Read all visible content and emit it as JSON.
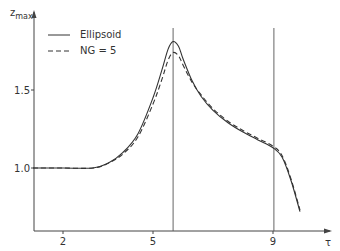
{
  "chart_data": {
    "type": "line",
    "title": "",
    "xlabel": "τ",
    "ylabel": "z_max",
    "ylabel_main": "z",
    "ylabel_sub": "max",
    "xlim": [
      1.0,
      11.3
    ],
    "ylim": [
      0.6,
      1.95
    ],
    "x_ticks": [
      2,
      5,
      9
    ],
    "x_tick_labels": [
      "2",
      "5",
      "9"
    ],
    "y_ticks": [
      1.0,
      1.5
    ],
    "y_tick_labels": [
      "1.0",
      "1.5"
    ],
    "grid": false,
    "legend_position": "upper-left",
    "vertical_lines": [
      5.67,
      9.03
    ],
    "series": [
      {
        "name": "Ellipsoid",
        "style": "solid",
        "x": [
          1.0,
          2.0,
          3.0,
          3.5,
          4.0,
          4.5,
          5.0,
          5.3,
          5.5,
          5.67,
          5.85,
          6.0,
          6.3,
          6.6,
          7.0,
          7.5,
          8.0,
          8.5,
          9.0,
          9.3,
          9.6,
          9.9
        ],
        "y": [
          1.0,
          1.0,
          1.0,
          1.03,
          1.1,
          1.22,
          1.45,
          1.63,
          1.76,
          1.81,
          1.78,
          1.7,
          1.56,
          1.46,
          1.37,
          1.29,
          1.23,
          1.18,
          1.13,
          1.07,
          0.92,
          0.72
        ]
      },
      {
        "name": "NG = 5",
        "style": "dashed",
        "x": [
          1.0,
          2.0,
          3.0,
          3.5,
          4.0,
          4.5,
          5.0,
          5.3,
          5.5,
          5.67,
          5.85,
          6.0,
          6.3,
          6.6,
          7.0,
          7.5,
          8.0,
          8.5,
          9.0,
          9.3,
          9.6,
          9.9
        ],
        "y": [
          1.0,
          1.0,
          1.0,
          1.03,
          1.09,
          1.2,
          1.41,
          1.57,
          1.69,
          1.74,
          1.72,
          1.66,
          1.55,
          1.47,
          1.38,
          1.3,
          1.24,
          1.19,
          1.14,
          1.08,
          0.93,
          0.73
        ]
      }
    ]
  },
  "legend": {
    "items": [
      {
        "label": "Ellipsoid",
        "style": "solid"
      },
      {
        "label": "NG = 5",
        "style": "dashed"
      }
    ]
  },
  "colors": {
    "line": "#333333",
    "axis": "#444444",
    "background": "#ffffff"
  }
}
